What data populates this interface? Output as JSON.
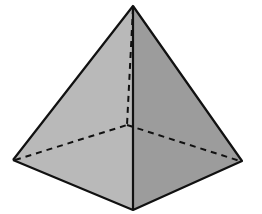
{
  "diagram": {
    "type": "square-pyramid",
    "vertices": {
      "apex": [
        133,
        6
      ],
      "back_hidden": [
        127,
        125
      ],
      "left": [
        13,
        160
      ],
      "right": [
        242,
        161
      ],
      "front": [
        133,
        210
      ]
    },
    "colors": {
      "background": "#ffffff",
      "left_face": "#b9b9b9",
      "right_face": "#9c9c9c",
      "edge": "#111111"
    },
    "edges_visible": [
      [
        "apex",
        "left"
      ],
      [
        "apex",
        "right"
      ],
      [
        "apex",
        "front"
      ],
      [
        "left",
        "front"
      ],
      [
        "front",
        "right"
      ]
    ],
    "edges_hidden": [
      [
        "apex",
        "back_hidden"
      ],
      [
        "left",
        "back_hidden"
      ],
      [
        "back_hidden",
        "right"
      ]
    ]
  }
}
